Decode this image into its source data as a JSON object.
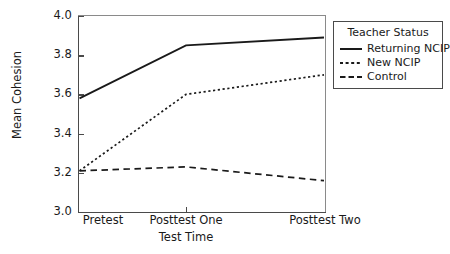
{
  "chart_data": {
    "type": "line",
    "title": "",
    "xlabel": "Test Time",
    "ylabel": "Mean Cohesion",
    "categories": [
      "Pretest",
      "Posttest One",
      "Posttest Two"
    ],
    "ylim": [
      3.0,
      4.0
    ],
    "yticks": [
      "3.0",
      "3.2",
      "3.4",
      "3.6",
      "3.8",
      "4.0"
    ],
    "ytick_values": [
      3.0,
      3.2,
      3.4,
      3.6,
      3.8,
      4.0
    ],
    "grid": false,
    "legend_position": "right-outside",
    "legend_title": "Teacher Status",
    "series": [
      {
        "name": "Returning NCIP",
        "style": "solid",
        "values": [
          3.58,
          3.85,
          3.89
        ]
      },
      {
        "name": "New NCIP",
        "style": "dotted",
        "values": [
          3.21,
          3.6,
          3.7
        ]
      },
      {
        "name": "Control",
        "style": "dashed",
        "values": [
          3.21,
          3.23,
          3.16
        ]
      }
    ]
  },
  "axes": {
    "y_label": "Mean Cohesion",
    "x_label": "Test Time",
    "y_ticks": [
      "4.0",
      "3.8",
      "3.6",
      "3.4",
      "3.2",
      "3.0"
    ],
    "x_ticks": [
      "Pretest",
      "Posttest One",
      "Posttest Two"
    ]
  },
  "legend": {
    "title": "Teacher Status",
    "items": [
      {
        "label": "Returning NCIP",
        "style": "solid"
      },
      {
        "label": "New NCIP",
        "style": "dotted"
      },
      {
        "label": "Control",
        "style": "dashed"
      }
    ]
  },
  "colors": {
    "line": "#1a1a1a",
    "axis": "#4a4a4a",
    "frame": "#8a8a8a",
    "background": "#ffffff"
  }
}
